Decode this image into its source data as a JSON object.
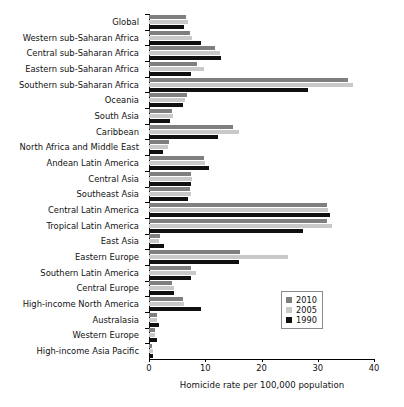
{
  "chart_data": {
    "type": "bar",
    "orientation": "horizontal",
    "title": "",
    "xlabel": "Homicide rate per 100,000 population",
    "ylabel": "",
    "xlim": [
      0,
      40
    ],
    "xticks": [
      0,
      10,
      20,
      30,
      40
    ],
    "xtick_labels": [
      "0",
      "10",
      "20",
      "30",
      "40"
    ],
    "grid": false,
    "legend_position": "inside-right-lower",
    "categories": [
      "Global",
      "Western sub-Saharan Africa",
      "Central sub-Saharan Africa",
      "Eastern sub-Saharan Africa",
      "Southern sub-Saharan Africa",
      "Oceania",
      "South Asia",
      "Caribbean",
      "North Africa and Middle East",
      "Andean Latin America",
      "Central Asia",
      "Southeast Asia",
      "Central Latin America",
      "Tropical Latin America",
      "East Asia",
      "Eastern Europe",
      "Southern Latin America",
      "Central Europe",
      "High-income North America",
      "Australasia",
      "Western Europe",
      "High-income Asia Pacific"
    ],
    "series": [
      {
        "name": "2010",
        "color": "#7f7f7f",
        "values": [
          6.6,
          7.2,
          11.8,
          8.6,
          35.4,
          6.7,
          4.0,
          15.0,
          3.5,
          9.7,
          7.4,
          7.2,
          31.6,
          31.6,
          1.9,
          16.2,
          7.4,
          4.0,
          6.0,
          1.4,
          1.0,
          0.6
        ]
      },
      {
        "name": "2005",
        "color": "#c9c9c9",
        "values": [
          6.9,
          7.6,
          12.7,
          9.7,
          36.2,
          6.4,
          4.2,
          16.0,
          3.4,
          10.0,
          7.6,
          7.4,
          31.9,
          32.6,
          1.8,
          24.7,
          8.3,
          4.4,
          6.3,
          1.4,
          1.1,
          0.7
        ]
      },
      {
        "name": "1990",
        "color": "#101010",
        "values": [
          6.3,
          9.2,
          12.8,
          7.5,
          28.3,
          6.1,
          3.7,
          12.2,
          2.5,
          10.6,
          7.4,
          7.0,
          32.1,
          27.4,
          2.6,
          16.0,
          7.5,
          4.5,
          9.3,
          1.7,
          1.4,
          0.7
        ]
      }
    ],
    "legend_entries": [
      "2010",
      "2005",
      "1990"
    ]
  }
}
